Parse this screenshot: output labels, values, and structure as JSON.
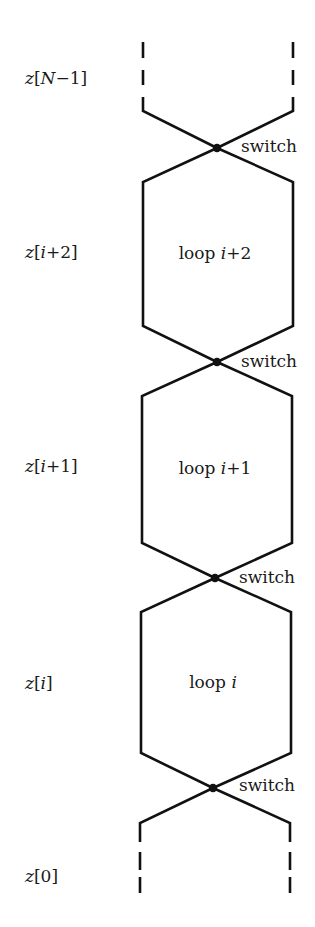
{
  "diagram": {
    "title": "",
    "colors": {
      "stroke": "#111111",
      "text": "#1a1a1a",
      "background": "#ffffff"
    },
    "row_labels": [
      {
        "id": "zN1",
        "prefix": "z",
        "open": "[",
        "var": "N",
        "rest": "−1",
        "close": "]",
        "text": "z[N−1]"
      },
      {
        "id": "zi2",
        "prefix": "z",
        "open": "[",
        "var": "i",
        "rest": "+2",
        "close": "]",
        "text": "z[i+2]"
      },
      {
        "id": "zi1",
        "prefix": "z",
        "open": "[",
        "var": "i",
        "rest": "+1",
        "close": "]",
        "text": "z[i+1]"
      },
      {
        "id": "zi",
        "prefix": "z",
        "open": "[",
        "var": "i",
        "rest": "",
        "close": "]",
        "text": "z[i]"
      },
      {
        "id": "z0",
        "prefix": "z",
        "open": "[",
        "var": "",
        "rest": "0",
        "close": "]",
        "text": "z[0]"
      }
    ],
    "loops": [
      {
        "word": "loop ",
        "var": "i",
        "suffix": "+2",
        "text": "loop i+2"
      },
      {
        "word": "loop ",
        "var": "i",
        "suffix": "+1",
        "text": "loop i+1"
      },
      {
        "word": "loop ",
        "var": "i",
        "suffix": "",
        "text": "loop i"
      }
    ],
    "switches": [
      {
        "label": "switch"
      },
      {
        "label": "switch"
      },
      {
        "label": "switch"
      },
      {
        "label": "switch"
      }
    ]
  }
}
